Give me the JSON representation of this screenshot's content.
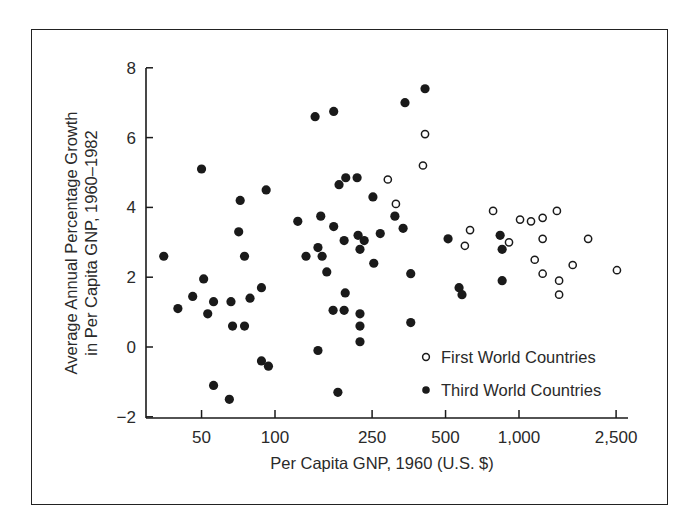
{
  "chart_data": {
    "type": "scatter",
    "title": "",
    "xlabel": "Per Capita GNP, 1960 (U.S. $)",
    "ylabel": "Average Annual Percentage Growth in Per Capita GNP, 1960–1982",
    "ylabel_lines": [
      "Average Annual Percentage Growth",
      "in Per Capita GNP, 1960–1982"
    ],
    "x_scale": "log",
    "xlim": [
      30,
      3000
    ],
    "ylim": [
      -2,
      8
    ],
    "x_ticks": [
      50,
      100,
      250,
      500,
      1000,
      2500
    ],
    "x_tick_labels": [
      "50",
      "100",
      "250",
      "500",
      "1,000",
      "2,500"
    ],
    "y_ticks": [
      -2,
      0,
      2,
      4,
      6,
      8
    ],
    "y_tick_labels": [
      "−2",
      "0",
      "2",
      "4",
      "6",
      "8"
    ],
    "grid": false,
    "legend_position": "lower right (inside plot)",
    "series": [
      {
        "name": "First World Countries",
        "marker": "open-circle",
        "points": [
          [
            290,
            4.8
          ],
          [
            313,
            4.1
          ],
          [
            404,
            5.2
          ],
          [
            412,
            6.1
          ],
          [
            600,
            2.9
          ],
          [
            630,
            3.35
          ],
          [
            783,
            3.9
          ],
          [
            910,
            3.0
          ],
          [
            1010,
            3.65
          ],
          [
            1120,
            3.6
          ],
          [
            1250,
            3.7
          ],
          [
            1250,
            3.1
          ],
          [
            1160,
            2.5
          ],
          [
            1250,
            2.1
          ],
          [
            1430,
            3.9
          ],
          [
            1460,
            1.9
          ],
          [
            1460,
            1.5
          ],
          [
            1660,
            2.35
          ],
          [
            1920,
            3.1
          ],
          [
            2520,
            2.2
          ]
        ]
      },
      {
        "name": "Third World Countries",
        "marker": "filled-circle",
        "points": [
          [
            35,
            2.6
          ],
          [
            40,
            1.1
          ],
          [
            46,
            1.45
          ],
          [
            51,
            1.95
          ],
          [
            50,
            5.1
          ],
          [
            53,
            0.95
          ],
          [
            56,
            1.3
          ],
          [
            56,
            -1.1
          ],
          [
            66,
            1.3
          ],
          [
            65,
            -1.5
          ],
          [
            67,
            0.6
          ],
          [
            72,
            4.2
          ],
          [
            71,
            3.3
          ],
          [
            75,
            2.6
          ],
          [
            75,
            0.6
          ],
          [
            79,
            1.4
          ],
          [
            88,
            1.7
          ],
          [
            92,
            4.5
          ],
          [
            88,
            -0.4
          ],
          [
            94,
            -0.55
          ],
          [
            124,
            3.6
          ],
          [
            134,
            2.6
          ],
          [
            146,
            6.6
          ],
          [
            150,
            2.85
          ],
          [
            154,
            3.75
          ],
          [
            156,
            2.6
          ],
          [
            150,
            -0.1
          ],
          [
            163,
            2.15
          ],
          [
            174,
            6.75
          ],
          [
            173,
            1.05
          ],
          [
            174,
            3.45
          ],
          [
            183,
            4.65
          ],
          [
            195,
            4.85
          ],
          [
            194,
            1.55
          ],
          [
            192,
            1.05
          ],
          [
            192,
            3.05
          ],
          [
            181,
            -1.3
          ],
          [
            217,
            4.85
          ],
          [
            219,
            3.2
          ],
          [
            232,
            3.05
          ],
          [
            223,
            2.8
          ],
          [
            223,
            0.95
          ],
          [
            223,
            0.6
          ],
          [
            223,
            0.15
          ],
          [
            252,
            4.3
          ],
          [
            254,
            2.4
          ],
          [
            270,
            3.25
          ],
          [
            310,
            3.75
          ],
          [
            335,
            3.4
          ],
          [
            341,
            7.0
          ],
          [
            360,
            2.1
          ],
          [
            360,
            0.7
          ],
          [
            412,
            7.4
          ],
          [
            512,
            3.1
          ],
          [
            568,
            1.7
          ],
          [
            584,
            1.5
          ],
          [
            837,
            3.2
          ],
          [
            853,
            2.8
          ],
          [
            853,
            1.9
          ]
        ]
      }
    ],
    "legend": [
      {
        "label": "First World Countries",
        "marker": "open-circle"
      },
      {
        "label": "Third World Countries",
        "marker": "filled-circle"
      }
    ]
  },
  "colors": {
    "ink": "#1a1a1a",
    "background": "#ffffff"
  }
}
